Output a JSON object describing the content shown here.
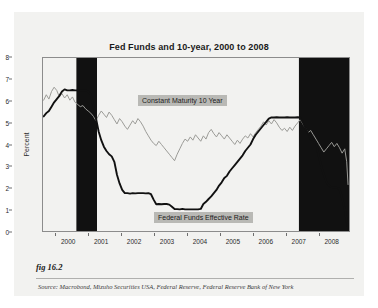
{
  "figure": {
    "caption_label": "fig 16.2",
    "source": "Source:  Macrobond, Mizuho Securities USA, Federal Reserve, Federal Reserve Bank of New York"
  },
  "chart_data": {
    "type": "line",
    "title": "Fed Funds and 10-year, 2000 to 2008",
    "xlabel": "",
    "ylabel": "Percent",
    "ylim": [
      0,
      8
    ],
    "xlim": [
      1999.6,
      2008.95
    ],
    "grid": false,
    "legend_position": "in-plot-annotations",
    "y_ticks": [
      0,
      1,
      2,
      3,
      4,
      5,
      6,
      7,
      8
    ],
    "x_ticks": [
      2000,
      2001,
      2002,
      2003,
      2004,
      2005,
      2006,
      2007,
      2008
    ],
    "colors": {
      "fed_funds": "#111111",
      "ten_year": "#9a9a96",
      "recession_band": "#111111",
      "plot_background": "#f2f2f0",
      "annotation_background": "#b9b9b5"
    },
    "shaded_regions": [
      {
        "name": "recession-band-2000-2001",
        "x_start": 2000.62,
        "x_end": 2001.25
      },
      {
        "name": "recession-band-2007-2008",
        "x_start": 2007.42,
        "x_end": 2008.95
      }
    ],
    "series": [
      {
        "name": "Constant Maturity 10 Year",
        "label": "Constant Maturity 10 Year",
        "color": "#9a9a96",
        "x": [
          1999.62,
          1999.7,
          1999.78,
          1999.86,
          1999.94,
          2000.02,
          2000.1,
          2000.18,
          2000.26,
          2000.34,
          2000.42,
          2000.5,
          2000.58,
          2000.66,
          2000.74,
          2000.82,
          2000.9,
          2000.98,
          2001.06,
          2001.14,
          2001.22,
          2001.3,
          2001.38,
          2001.46,
          2001.54,
          2001.62,
          2001.7,
          2001.78,
          2001.86,
          2001.94,
          2002.02,
          2002.1,
          2002.18,
          2002.26,
          2002.34,
          2002.42,
          2002.5,
          2002.58,
          2002.66,
          2002.74,
          2002.82,
          2002.9,
          2002.98,
          2003.06,
          2003.14,
          2003.22,
          2003.3,
          2003.38,
          2003.46,
          2003.54,
          2003.62,
          2003.7,
          2003.78,
          2003.86,
          2003.94,
          2004.02,
          2004.1,
          2004.18,
          2004.26,
          2004.34,
          2004.42,
          2004.5,
          2004.58,
          2004.66,
          2004.74,
          2004.82,
          2004.9,
          2004.98,
          2005.06,
          2005.14,
          2005.22,
          2005.3,
          2005.38,
          2005.46,
          2005.54,
          2005.62,
          2005.7,
          2005.78,
          2005.86,
          2005.94,
          2006.02,
          2006.1,
          2006.18,
          2006.26,
          2006.34,
          2006.42,
          2006.5,
          2006.58,
          2006.66,
          2006.74,
          2006.82,
          2006.9,
          2006.98,
          2007.06,
          2007.14,
          2007.22,
          2007.3,
          2007.38,
          2007.46,
          2007.54,
          2007.62,
          2007.7,
          2007.78,
          2007.86,
          2007.94,
          2008.02,
          2008.1,
          2008.18,
          2008.26,
          2008.34,
          2008.42,
          2008.5,
          2008.58,
          2008.66,
          2008.74,
          2008.82,
          2008.88,
          2008.92
        ],
        "y": [
          6.05,
          6.3,
          6.1,
          6.45,
          6.65,
          6.5,
          6.2,
          6.35,
          6.15,
          6.3,
          6.05,
          6.2,
          5.95,
          5.85,
          5.75,
          5.8,
          5.65,
          5.55,
          5.45,
          5.3,
          5.1,
          5.35,
          5.55,
          5.4,
          5.25,
          5.5,
          5.35,
          5.15,
          4.95,
          5.2,
          5.05,
          4.85,
          4.7,
          4.9,
          5.1,
          4.95,
          5.2,
          5.05,
          4.85,
          4.6,
          4.4,
          4.2,
          4.05,
          3.95,
          4.15,
          4.0,
          3.85,
          3.7,
          3.55,
          3.4,
          3.25,
          3.55,
          3.8,
          4.05,
          4.25,
          4.15,
          4.35,
          4.2,
          4.45,
          4.3,
          4.15,
          4.4,
          4.25,
          4.55,
          4.7,
          4.5,
          4.35,
          4.55,
          4.4,
          4.25,
          4.45,
          4.3,
          4.15,
          4.0,
          4.2,
          4.05,
          4.25,
          4.4,
          4.3,
          4.5,
          4.35,
          4.55,
          4.7,
          4.85,
          5.05,
          4.9,
          5.1,
          4.95,
          5.15,
          5.0,
          4.8,
          4.65,
          4.75,
          4.6,
          4.8,
          4.65,
          4.85,
          5.0,
          5.15,
          4.95,
          4.75,
          4.55,
          4.65,
          4.45,
          4.25,
          4.05,
          3.85,
          3.65,
          3.8,
          3.95,
          4.1,
          3.9,
          4.05,
          3.85,
          3.6,
          3.8,
          3.2,
          2.15
        ]
      },
      {
        "name": "Federal Funds Effective Rate",
        "label": "Federal Funds Effective Rate",
        "color": "#111111",
        "x": [
          1999.62,
          1999.7,
          1999.78,
          1999.86,
          1999.94,
          2000.02,
          2000.1,
          2000.18,
          2000.26,
          2000.34,
          2000.42,
          2000.5,
          2000.58,
          2000.66,
          2000.74,
          2000.82,
          2000.9,
          2000.98,
          2001.06,
          2001.14,
          2001.22,
          2001.3,
          2001.38,
          2001.46,
          2001.54,
          2001.62,
          2001.7,
          2001.78,
          2001.86,
          2001.94,
          2002.02,
          2002.1,
          2002.18,
          2002.26,
          2002.34,
          2002.42,
          2002.5,
          2002.58,
          2002.66,
          2002.74,
          2002.82,
          2002.9,
          2002.98,
          2003.06,
          2003.14,
          2003.22,
          2003.3,
          2003.38,
          2003.46,
          2003.54,
          2003.62,
          2003.7,
          2003.78,
          2003.86,
          2003.94,
          2004.02,
          2004.1,
          2004.18,
          2004.26,
          2004.34,
          2004.42,
          2004.5,
          2004.58,
          2004.66,
          2004.74,
          2004.82,
          2004.9,
          2004.98,
          2005.06,
          2005.14,
          2005.22,
          2005.3,
          2005.38,
          2005.46,
          2005.54,
          2005.62,
          2005.7,
          2005.78,
          2005.86,
          2005.94,
          2006.02,
          2006.1,
          2006.18,
          2006.26,
          2006.34,
          2006.42,
          2006.5,
          2006.58,
          2006.66,
          2006.74,
          2006.82,
          2006.9,
          2006.98,
          2007.06,
          2007.14,
          2007.22,
          2007.3,
          2007.38,
          2007.46,
          2007.54,
          2007.62,
          2007.7,
          2007.78,
          2007.86,
          2007.94,
          2008.02,
          2008.1,
          2008.18,
          2008.26,
          2008.34,
          2008.42,
          2008.5,
          2008.58,
          2008.66,
          2008.74,
          2008.82,
          2008.88,
          2008.92
        ],
        "y": [
          5.3,
          5.45,
          5.55,
          5.75,
          5.95,
          6.1,
          6.25,
          6.45,
          6.55,
          6.5,
          6.5,
          6.52,
          6.5,
          6.5,
          6.5,
          6.5,
          6.5,
          6.45,
          6.3,
          5.8,
          5.2,
          4.6,
          4.2,
          3.9,
          3.7,
          3.55,
          3.45,
          3.2,
          2.6,
          2.2,
          1.9,
          1.75,
          1.75,
          1.73,
          1.75,
          1.74,
          1.75,
          1.75,
          1.75,
          1.74,
          1.75,
          1.7,
          1.45,
          1.24,
          1.25,
          1.24,
          1.25,
          1.25,
          1.22,
          1.12,
          1.02,
          1.01,
          1.0,
          1.02,
          1.0,
          1.0,
          1.0,
          1.0,
          1.0,
          1.0,
          1.02,
          1.25,
          1.35,
          1.48,
          1.6,
          1.75,
          1.9,
          2.1,
          2.25,
          2.45,
          2.55,
          2.75,
          2.9,
          3.05,
          3.2,
          3.35,
          3.5,
          3.7,
          3.85,
          4.0,
          4.25,
          4.45,
          4.6,
          4.75,
          4.9,
          5.05,
          5.2,
          5.25,
          5.25,
          5.26,
          5.25,
          5.25,
          5.25,
          5.26,
          5.25,
          5.25,
          5.25,
          5.26,
          5.25,
          5.02,
          4.75,
          4.5,
          4.25,
          4.2,
          4.1,
          3.5,
          3.0,
          2.6,
          2.25,
          2.1,
          2.0,
          2.0,
          2.0,
          1.95,
          1.5,
          1.0,
          0.45,
          0.15
        ]
      }
    ]
  }
}
